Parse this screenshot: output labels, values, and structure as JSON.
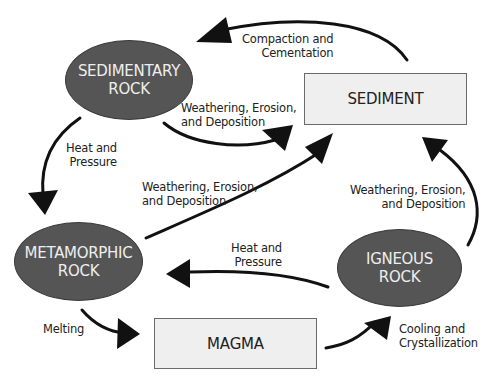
{
  "colors": {
    "rock_fill": "#555555",
    "rock_text": "#eeeeee",
    "box_fill": "#efefef",
    "box_border": "#6a6a6a",
    "arrow": "#111111"
  },
  "nodes": {
    "sedimentary": {
      "line1": "SEDIMENTARY",
      "line2": "ROCK"
    },
    "sediment": {
      "label": "SEDIMENT"
    },
    "metamorphic": {
      "line1": "METAMORPHIC",
      "line2": "ROCK"
    },
    "igneous": {
      "line1": "IGNEOUS",
      "line2": "ROCK"
    },
    "magma": {
      "label": "MAGMA"
    }
  },
  "processes": {
    "compaction": {
      "line1": "Compaction and",
      "line2": "Cementation"
    },
    "sed_weathering": {
      "line1": "Weathering, Erosion,",
      "line2": "and Deposition"
    },
    "sed_heat": {
      "line1": "Heat and",
      "line2": "Pressure"
    },
    "meta_weathering": {
      "line1": "Weathering, Erosion,",
      "line2": "and Deposition"
    },
    "ign_weathering": {
      "line1": "Weathering, Erosion,",
      "line2": "and Deposition"
    },
    "ign_heat": {
      "line1": "Heat and",
      "line2": "Pressure"
    },
    "melting": {
      "label": "Melting"
    },
    "cooling": {
      "line1": "Cooling and",
      "line2": "Crystallization"
    }
  }
}
